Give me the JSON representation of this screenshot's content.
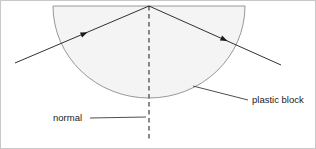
{
  "figure": {
    "background_color": "#ffffff",
    "border_color": "#c8c8c8",
    "width": 316,
    "height": 149
  },
  "block": {
    "name": "plastic block",
    "shape": "semicircle-with-flat-top",
    "fill_color": "#f4f4f4",
    "stroke_color": "#8c8c8c",
    "flat_top_y": 5,
    "left_x": 52,
    "right_x": 244,
    "center_x": 148,
    "bottom_y": 97,
    "radius": 92
  },
  "labels": {
    "normal": "normal",
    "plastic_block": "plastic block"
  },
  "normal_line": {
    "name": "normal",
    "style": "dashed",
    "color": "#4a4a4a",
    "x": 148,
    "y_start": 5,
    "y_end": 141
  },
  "rays": [
    {
      "name": "incident-ray",
      "from": [
        14,
        62
      ],
      "to": [
        148,
        5
      ],
      "arrow_at": [
        78,
        35
      ],
      "color": "#1a1a1a"
    },
    {
      "name": "refracted-ray",
      "from": [
        148,
        5
      ],
      "to": [
        280,
        64
      ],
      "arrow_at": [
        218,
        36
      ],
      "color": "#1a1a1a"
    }
  ],
  "leader_lines": [
    {
      "name": "normal-leader",
      "from": [
        89,
        117
      ],
      "to": [
        145,
        116
      ],
      "color": "#3a3a3a"
    },
    {
      "name": "plastic-block-leader",
      "from": [
        192,
        85
      ],
      "to": [
        246,
        99
      ],
      "color": "#3a3a3a"
    }
  ],
  "text_positions": {
    "normal": {
      "x": 52,
      "y": 120
    },
    "plastic_block": {
      "x": 250,
      "y": 102
    }
  }
}
